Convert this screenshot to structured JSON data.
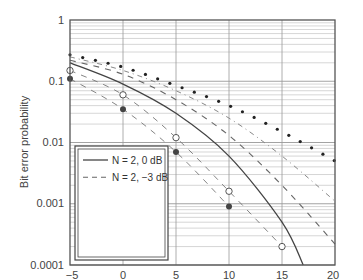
{
  "chart_data": {
    "type": "line",
    "title": "",
    "xlabel": "γ̄1(dB)",
    "ylabel": "Bit error probability",
    "xlim": [
      -5,
      20
    ],
    "ylim": [
      0.0001,
      1
    ],
    "yscale": "log",
    "grid": true,
    "legend_position": "lower-left",
    "x_ticks": [
      "-5",
      "0",
      "5",
      "10",
      "15",
      "20"
    ],
    "y_ticks": [
      "1",
      "0.1",
      "0.01",
      "0.001",
      "0.0001"
    ],
    "series": [
      {
        "name": "N = 2, 0 dB",
        "style": "solid",
        "x": [
          -5,
          0,
          5,
          10,
          15,
          17
        ],
        "values": [
          0.2,
          0.09,
          0.03,
          0.006,
          0.0005,
          0.0001
        ]
      },
      {
        "name": "N = 2, −3 dB",
        "style": "dashed",
        "x": [
          -5,
          0,
          5,
          10,
          15,
          20
        ],
        "values": [
          0.22,
          0.13,
          0.05,
          0.013,
          0.002,
          0.00022
        ]
      },
      {
        "name": "N = 2, 3 dB",
        "style": "open-circle",
        "x": [
          -5,
          0,
          5,
          10,
          15
        ],
        "values": [
          0.15,
          0.06,
          0.012,
          0.0016,
          0.0002
        ]
      },
      {
        "name": "N = 2, −6 dB",
        "style": "dash-dot",
        "x": [
          -5,
          0,
          5,
          10,
          15,
          20
        ],
        "values": [
          0.25,
          0.15,
          0.07,
          0.025,
          0.006,
          0.0011
        ]
      },
      {
        "name": "N = 2, 6 dB",
        "style": "filled-circle",
        "x": [
          -5,
          0,
          5,
          10
        ],
        "values": [
          0.11,
          0.035,
          0.007,
          0.0009
        ]
      },
      {
        "name": "N = 1",
        "style": "dotted",
        "x": [
          -5,
          0,
          5,
          10,
          15,
          20
        ],
        "values": [
          0.27,
          0.17,
          0.085,
          0.04,
          0.015,
          0.005
        ]
      }
    ]
  },
  "legend": {
    "items": [
      {
        "label": "N = 2, 0 dB"
      },
      {
        "label": "N = 2, −3 dB"
      },
      {
        "label": "N = 2, 3 dB"
      },
      {
        "label": "N = 2, −6 dB"
      },
      {
        "label": "N = 2, 6 dB"
      },
      {
        "label": "N = 1"
      }
    ]
  },
  "axes": {
    "ylabel": "Bit error probability",
    "xlabel_main": "γ̄",
    "xlabel_sub": "1",
    "xlabel_unit": "(dB)",
    "x_ticks": [
      "−5",
      "0",
      "5",
      "10",
      "15",
      "20"
    ],
    "y_ticks": [
      "1",
      "0.1",
      "0.01",
      "0.001",
      "0.0001"
    ]
  },
  "colors": {
    "line": "#444444",
    "grid": "#bbbbbb",
    "frame": "#555555"
  }
}
